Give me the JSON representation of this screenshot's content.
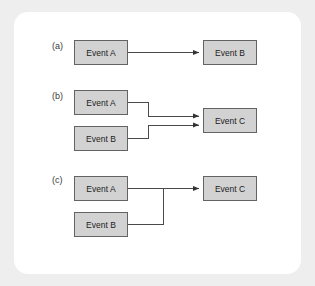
{
  "figure": {
    "panel_background": "#ffffff",
    "outer_background": "#eeeeee",
    "box_fill": "#d2d2d2",
    "box_border": "#636363",
    "connector_color": "#4a4a4a"
  },
  "groups": [
    {
      "label": "(a)",
      "label_x": 52,
      "label_y": 42,
      "description": "Event A leads to Event B",
      "boxes": [
        {
          "text": "Event A",
          "x": 74,
          "y": 40,
          "w": 54,
          "h": 25
        },
        {
          "text": "Event B",
          "x": 203,
          "y": 40,
          "w": 54,
          "h": 25
        }
      ],
      "connectors": [
        {
          "from": "Event A",
          "to": "Event B",
          "points": "128,52.5 199,52.5",
          "arrow": true,
          "arrow_at": "203,52.5"
        }
      ]
    },
    {
      "label": "(b)",
      "label_x": 52,
      "label_y": 92,
      "description": "Event A and Event B each lead independently to Event C",
      "boxes": [
        {
          "text": "Event A",
          "x": 74,
          "y": 90,
          "w": 54,
          "h": 25
        },
        {
          "text": "Event B",
          "x": 74,
          "y": 126,
          "w": 54,
          "h": 25
        },
        {
          "text": "Event C",
          "x": 203,
          "y": 108,
          "w": 54,
          "h": 25
        }
      ],
      "connectors": [
        {
          "from": "Event A",
          "to": "Event C",
          "points": "128,102.5 148,102.5 148,116 199,116",
          "arrow": true,
          "arrow_at": "203,116"
        },
        {
          "from": "Event B",
          "to": "Event C",
          "points": "128,138.5 148,138.5 148,125 199,125",
          "arrow": true,
          "arrow_at": "203,125"
        }
      ]
    },
    {
      "label": "(c)",
      "label_x": 52,
      "label_y": 176,
      "description": "Event A and Event B merge at a junction into a single path to Event C",
      "boxes": [
        {
          "text": "Event A",
          "x": 74,
          "y": 176,
          "w": 54,
          "h": 25
        },
        {
          "text": "Event B",
          "x": 74,
          "y": 212,
          "w": 54,
          "h": 25
        },
        {
          "text": "Event C",
          "x": 203,
          "y": 176,
          "w": 54,
          "h": 25
        }
      ],
      "connectors": [
        {
          "from": "Event A",
          "to": "Event C",
          "points": "128,188.5 199,188.5",
          "arrow": true,
          "arrow_at": "203,188.5"
        },
        {
          "from": "Event B",
          "to": "junction",
          "points": "128,224.5 163,224.5 163,188.5",
          "arrow": false,
          "arrow_at": ""
        }
      ]
    }
  ]
}
